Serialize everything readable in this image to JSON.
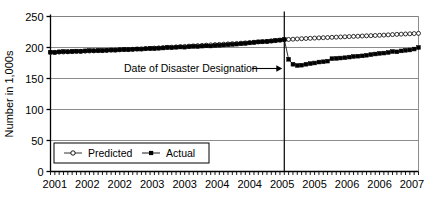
{
  "chart_data": {
    "type": "line",
    "title": "",
    "xlabel": "",
    "ylabel": "Number in 1,000s",
    "ylim": [
      0,
      250
    ],
    "yticks": [
      0,
      50,
      100,
      150,
      200,
      250
    ],
    "ytick_labels": [
      "0",
      "50",
      "100",
      "150",
      "200",
      "250"
    ],
    "xtick_labels": [
      "2001",
      "2002",
      "2002",
      "2003",
      "2003",
      "2004",
      "2004",
      "2005",
      "2005",
      "2006",
      "2006",
      "2007"
    ],
    "grid": true,
    "legend_position": "lower-left-inside",
    "x_minor_ticks_per_label": 6,
    "annotations": [
      {
        "name": "disaster-designation-annotation",
        "text": "Date of Disaster Designation",
        "arrow": "→",
        "vline_x_index": 54
      }
    ],
    "series": [
      {
        "name": "Predicted",
        "marker": "open-circle",
        "color": "#000000",
        "x": [
          0,
          1,
          2,
          3,
          4,
          5,
          6,
          7,
          8,
          9,
          10,
          11,
          12,
          13,
          14,
          15,
          16,
          17,
          18,
          19,
          20,
          21,
          22,
          23,
          24,
          25,
          26,
          27,
          28,
          29,
          30,
          31,
          32,
          33,
          34,
          35,
          36,
          37,
          38,
          39,
          40,
          41,
          42,
          43,
          44,
          45,
          46,
          47,
          48,
          49,
          50,
          51,
          52,
          53,
          54,
          55,
          56,
          57,
          58,
          59,
          60,
          61,
          62,
          63,
          64,
          65,
          66,
          67,
          68,
          69,
          70,
          71,
          72,
          73,
          74,
          75,
          76,
          77,
          78,
          79,
          80,
          81,
          82,
          83,
          84,
          85
        ],
        "values": [
          192.0,
          192.3,
          192.5,
          192.8,
          193.0,
          193.3,
          193.5,
          193.8,
          194.0,
          194.3,
          194.5,
          194.8,
          195.0,
          195.3,
          195.6,
          195.9,
          196.2,
          196.5,
          196.8,
          197.1,
          197.4,
          197.8,
          198.2,
          198.6,
          199.0,
          199.4,
          199.8,
          200.2,
          200.6,
          201.0,
          201.4,
          201.8,
          202.2,
          202.6,
          203.0,
          203.4,
          203.8,
          204.2,
          204.6,
          205.0,
          205.4,
          205.8,
          206.2,
          206.6,
          207.0,
          207.5,
          208.0,
          208.5,
          209.0,
          209.5,
          210.0,
          210.6,
          211.2,
          211.8,
          212.4,
          213.0,
          213.4,
          213.8,
          214.2,
          214.5,
          214.8,
          215.2,
          215.5,
          215.8,
          216.1,
          216.4,
          216.7,
          217.0,
          217.3,
          217.6,
          217.9,
          218.2,
          218.5,
          218.8,
          219.1,
          219.4,
          219.7,
          220.0,
          220.4,
          220.8,
          221.2,
          221.5,
          221.8,
          222.1,
          222.5,
          222.8
        ]
      },
      {
        "name": "Actual",
        "marker": "filled-square",
        "color": "#000000",
        "x": [
          0,
          1,
          2,
          3,
          4,
          5,
          6,
          7,
          8,
          9,
          10,
          11,
          12,
          13,
          14,
          15,
          16,
          17,
          18,
          19,
          20,
          21,
          22,
          23,
          24,
          25,
          26,
          27,
          28,
          29,
          30,
          31,
          32,
          33,
          34,
          35,
          36,
          37,
          38,
          39,
          40,
          41,
          42,
          43,
          44,
          45,
          46,
          47,
          48,
          49,
          50,
          51,
          52,
          53,
          54,
          55,
          56,
          57,
          58,
          59,
          60,
          61,
          62,
          63,
          64,
          65,
          66,
          67,
          68,
          69,
          70,
          71,
          72,
          73,
          74,
          75,
          76,
          77,
          78,
          79,
          80,
          81,
          82,
          83,
          84,
          85
        ],
        "values": [
          192.5,
          192.0,
          193.0,
          193.5,
          193.2,
          193.8,
          194.2,
          193.9,
          194.6,
          195.0,
          194.8,
          195.2,
          195.0,
          195.6,
          196.0,
          195.8,
          196.4,
          196.8,
          196.5,
          197.2,
          197.6,
          197.4,
          198.0,
          198.4,
          198.2,
          198.8,
          199.2,
          200.0,
          199.6,
          200.4,
          200.8,
          200.5,
          201.2,
          201.8,
          201.5,
          202.2,
          202.6,
          202.4,
          203.2,
          203.6,
          204.0,
          204.4,
          205.0,
          205.4,
          206.0,
          206.6,
          207.4,
          208.2,
          209.0,
          209.2,
          209.6,
          210.4,
          211.2,
          212.0,
          213.0,
          181.0,
          173.0,
          171.0,
          171.5,
          173.0,
          174.0,
          175.0,
          176.5,
          177.0,
          178.0,
          182.0,
          182.5,
          183.0,
          183.5,
          184.5,
          185.5,
          186.0,
          186.5,
          187.5,
          188.5,
          189.5,
          190.5,
          191.0,
          192.0,
          193.5,
          193.0,
          194.5,
          195.5,
          196.0,
          197.5,
          200.0
        ]
      }
    ]
  },
  "legend": {
    "items": [
      {
        "label": "Predicted",
        "marker": "open-circle"
      },
      {
        "label": "Actual",
        "marker": "filled-square"
      }
    ]
  }
}
